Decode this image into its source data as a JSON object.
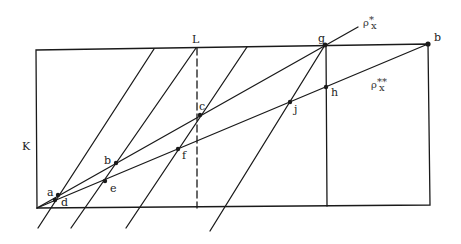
{
  "diagram": {
    "type": "geometric-construction",
    "stroke_color": "#1a1a1a",
    "background": "#ffffff",
    "region_label": "K",
    "dashed_line_label": "L",
    "points": [
      {
        "id": "a",
        "label": "a"
      },
      {
        "id": "b_left",
        "label": "b"
      },
      {
        "id": "c",
        "label": "c"
      },
      {
        "id": "d",
        "label": "d"
      },
      {
        "id": "e",
        "label": "e"
      },
      {
        "id": "f",
        "label": "f"
      },
      {
        "id": "g",
        "label": "g"
      },
      {
        "id": "h",
        "label": "h"
      },
      {
        "id": "j",
        "label": "j"
      },
      {
        "id": "b_corner",
        "label": "b"
      }
    ],
    "rays": [
      {
        "id": "rho_star",
        "base": "ρ",
        "superscript": "*",
        "subscript": "x"
      },
      {
        "id": "rho_double_star",
        "base": "ρ",
        "superscript": "**",
        "subscript": "x"
      }
    ]
  }
}
